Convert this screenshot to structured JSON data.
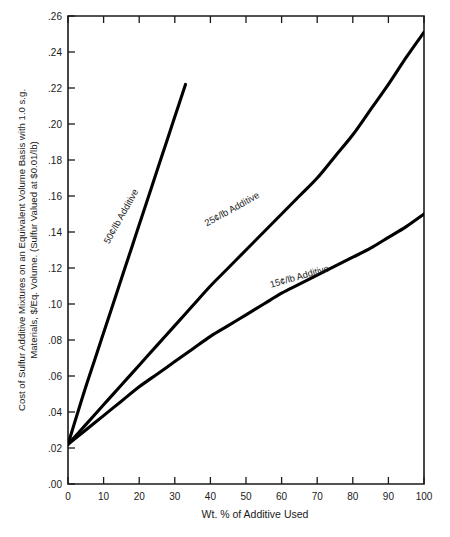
{
  "chart_data": {
    "type": "line",
    "title": "",
    "xlabel": "Wt. % of Additive Used",
    "ylabel_line1": "Cost of Sulfur Additive Mixtures on an Equivalent Volume Basis with 1.0 s.g.",
    "ylabel_line2": "Materials, $/Eq. Volume. (Sulfur Valued at $0.01/lb)",
    "xlim": [
      0,
      100
    ],
    "ylim": [
      0.0,
      0.26
    ],
    "xticks": [
      0,
      10,
      20,
      30,
      40,
      50,
      60,
      70,
      80,
      90,
      100
    ],
    "xtick_labels": [
      "0",
      "10",
      "20",
      "30",
      "40",
      "50",
      "60",
      "70",
      "80",
      "90",
      "100"
    ],
    "yticks": [
      0.0,
      0.02,
      0.04,
      0.06,
      0.08,
      0.1,
      0.12,
      0.14,
      0.16,
      0.18,
      0.2,
      0.22,
      0.24,
      0.26
    ],
    "ytick_labels": [
      ".00",
      ".02",
      ".04",
      ".06",
      ".08",
      ".10",
      ".12",
      ".14",
      ".16",
      ".18",
      ".20",
      ".22",
      ".24",
      ".26"
    ],
    "grid": false,
    "legend": "inline-curve-labels",
    "series": [
      {
        "name": "50¢/lb Additive",
        "label": "50¢/lb Additive",
        "color": "#000000",
        "x": [
          0,
          2,
          5,
          8,
          10,
          12,
          15,
          18,
          20,
          22,
          25,
          28,
          30,
          32,
          33
        ],
        "values": [
          0.022,
          0.035,
          0.054,
          0.072,
          0.084,
          0.096,
          0.114,
          0.132,
          0.144,
          0.156,
          0.174,
          0.192,
          0.204,
          0.216,
          0.222
        ]
      },
      {
        "name": "25¢/lb Additive",
        "label": "25¢/lb Additive",
        "color": "#000000",
        "x": [
          0,
          5,
          10,
          15,
          20,
          25,
          30,
          35,
          40,
          45,
          50,
          55,
          60,
          65,
          70,
          75,
          80,
          85,
          90,
          95,
          100
        ],
        "values": [
          0.022,
          0.033,
          0.044,
          0.055,
          0.066,
          0.077,
          0.088,
          0.099,
          0.11,
          0.12,
          0.13,
          0.14,
          0.15,
          0.16,
          0.17,
          0.182,
          0.194,
          0.208,
          0.222,
          0.237,
          0.251
        ]
      },
      {
        "name": "15¢/lb Additive",
        "label": "15¢/lb Additive",
        "color": "#000000",
        "x": [
          0,
          5,
          10,
          15,
          20,
          25,
          30,
          35,
          40,
          45,
          50,
          55,
          60,
          65,
          70,
          75,
          80,
          85,
          90,
          95,
          100
        ],
        "values": [
          0.022,
          0.03,
          0.038,
          0.046,
          0.054,
          0.061,
          0.068,
          0.075,
          0.082,
          0.088,
          0.094,
          0.1,
          0.106,
          0.111,
          0.116,
          0.121,
          0.126,
          0.131,
          0.137,
          0.143,
          0.15
        ]
      }
    ],
    "annotations": [
      {
        "text": "50¢/lb Additive",
        "x_pct": 11.5,
        "y_val": 0.133,
        "rotation": -61
      },
      {
        "text": "25¢/lb Additive",
        "x_pct": 39.0,
        "y_val": 0.143,
        "rotation": -29
      },
      {
        "text": "15¢/lb Additive",
        "x_pct": 57.0,
        "y_val": 0.109,
        "rotation": -16
      }
    ]
  }
}
